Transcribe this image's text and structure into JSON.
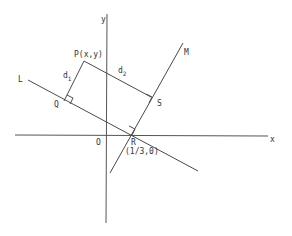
{
  "figure": {
    "axes": {
      "x_label": "x",
      "y_label": "y",
      "origin_label": "O"
    },
    "lines": {
      "L_label": "L",
      "M_label": "M"
    },
    "points": {
      "P_label": "P(x,y)",
      "Q_label": "Q",
      "S_label": "S",
      "R_label": "R",
      "R_coords": "(1/3,0)"
    },
    "distances": {
      "d1_main": "d",
      "d1_sub": "1",
      "d2_main": "d",
      "d2_sub": "2"
    },
    "colors": {
      "line": "#4a4a4a",
      "text": "#333333",
      "background": "#ffffff"
    }
  }
}
